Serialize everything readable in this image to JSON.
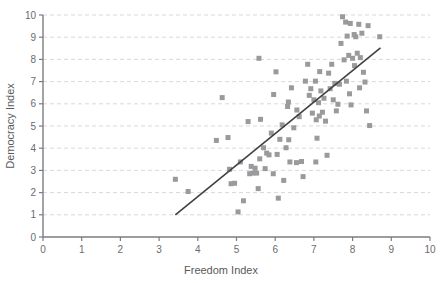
{
  "chart_data": {
    "type": "scatter",
    "title": "",
    "subtitle": "",
    "xlabel": "Freedom Index",
    "ylabel": "Democracy Index",
    "xlim": [
      0,
      10
    ],
    "ylim": [
      0,
      10
    ],
    "xticks": [
      0,
      1,
      2,
      3,
      4,
      5,
      6,
      7,
      8,
      9,
      10
    ],
    "yticks": [
      0,
      1,
      2,
      3,
      4,
      5,
      6,
      7,
      8,
      9,
      10
    ],
    "grid": {
      "horizontal": true,
      "vertical": false,
      "style": "dashed",
      "color": "#d9d9dd"
    },
    "legend": {
      "visible": false,
      "position": "none"
    },
    "marker": {
      "shape": "square",
      "color": "#9a9a9c",
      "size": 5
    },
    "trendline": {
      "visible": true,
      "color": "#404042",
      "width": 1.6,
      "x_start": 3.42,
      "y_start": 1.0,
      "x_end": 8.72,
      "y_end": 8.52
    },
    "series": [
      {
        "name": "Countries",
        "points": [
          [
            3.42,
            2.6
          ],
          [
            3.75,
            2.05
          ],
          [
            4.48,
            4.35
          ],
          [
            4.63,
            6.28
          ],
          [
            4.78,
            4.48
          ],
          [
            4.82,
            3.05
          ],
          [
            4.86,
            2.4
          ],
          [
            4.95,
            2.42
          ],
          [
            5.04,
            1.13
          ],
          [
            5.1,
            3.38
          ],
          [
            5.18,
            1.63
          ],
          [
            5.3,
            5.2
          ],
          [
            5.34,
            2.85
          ],
          [
            5.38,
            3.18
          ],
          [
            5.42,
            2.88
          ],
          [
            5.48,
            3.1
          ],
          [
            5.52,
            2.88
          ],
          [
            5.56,
            2.18
          ],
          [
            5.58,
            8.05
          ],
          [
            5.6,
            3.52
          ],
          [
            5.62,
            5.3
          ],
          [
            5.7,
            4.02
          ],
          [
            5.74,
            3.08
          ],
          [
            5.78,
            3.78
          ],
          [
            5.84,
            3.7
          ],
          [
            5.9,
            4.68
          ],
          [
            5.96,
            6.42
          ],
          [
            6.02,
            7.44
          ],
          [
            6.08,
            1.75
          ],
          [
            6.12,
            4.4
          ],
          [
            6.18,
            5.05
          ],
          [
            6.22,
            2.55
          ],
          [
            6.28,
            4.02
          ],
          [
            6.32,
            5.88
          ],
          [
            6.34,
            6.08
          ],
          [
            6.38,
            3.38
          ],
          [
            6.42,
            6.72
          ],
          [
            6.48,
            4.92
          ],
          [
            6.56,
            5.72
          ],
          [
            6.62,
            5.42
          ],
          [
            6.68,
            3.4
          ],
          [
            6.72,
            2.72
          ],
          [
            6.78,
            7.02
          ],
          [
            6.84,
            7.78
          ],
          [
            6.88,
            6.38
          ],
          [
            6.92,
            6.68
          ],
          [
            6.96,
            5.58
          ],
          [
            7.0,
            6.18
          ],
          [
            7.04,
            7.02
          ],
          [
            7.06,
            5.28
          ],
          [
            7.08,
            4.45
          ],
          [
            7.12,
            6.05
          ],
          [
            7.14,
            5.45
          ],
          [
            7.18,
            6.58
          ],
          [
            7.22,
            5.62
          ],
          [
            7.26,
            6.25
          ],
          [
            7.3,
            5.22
          ],
          [
            7.34,
            3.68
          ],
          [
            7.38,
            7.38
          ],
          [
            7.42,
            6.68
          ],
          [
            7.46,
            7.78
          ],
          [
            7.5,
            6.18
          ],
          [
            7.54,
            6.92
          ],
          [
            7.58,
            5.68
          ],
          [
            7.62,
            5.98
          ],
          [
            7.66,
            6.88
          ],
          [
            7.7,
            8.72
          ],
          [
            7.74,
            9.92
          ],
          [
            7.78,
            7.98
          ],
          [
            7.82,
            9.68
          ],
          [
            7.84,
            7.02
          ],
          [
            7.86,
            9.05
          ],
          [
            7.9,
            8.18
          ],
          [
            7.94,
            9.62
          ],
          [
            7.96,
            5.95
          ],
          [
            8.0,
            8.05
          ],
          [
            8.04,
            9.12
          ],
          [
            8.08,
            9.02
          ],
          [
            8.12,
            8.28
          ],
          [
            8.16,
            9.58
          ],
          [
            8.2,
            8.08
          ],
          [
            8.24,
            9.18
          ],
          [
            8.28,
            7.42
          ],
          [
            8.32,
            6.98
          ],
          [
            8.36,
            5.68
          ],
          [
            8.4,
            9.52
          ],
          [
            8.44,
            5.02
          ],
          [
            8.7,
            9.02
          ],
          [
            6.05,
            3.72
          ],
          [
            6.55,
            3.35
          ],
          [
            7.05,
            3.38
          ],
          [
            5.95,
            2.85
          ],
          [
            6.35,
            4.38
          ],
          [
            7.15,
            7.45
          ],
          [
            8.05,
            7.72
          ],
          [
            8.18,
            6.72
          ],
          [
            7.92,
            6.45
          ]
        ]
      }
    ]
  },
  "axes": {
    "x_title": "Freedom Index",
    "y_title": "Democracy Index",
    "x_tick_labels": [
      "0",
      "1",
      "2",
      "3",
      "4",
      "5",
      "6",
      "7",
      "8",
      "9",
      "10"
    ],
    "y_tick_labels": [
      "0",
      "1",
      "2",
      "3",
      "4",
      "5",
      "6",
      "7",
      "8",
      "9",
      "10"
    ]
  },
  "colors": {
    "marker": "#9a9a9c",
    "trendline": "#404042",
    "gridline": "#d9d9dd",
    "axis": "#7d7d80",
    "tick_text": "#6b6b6d",
    "title_text": "#59595b",
    "background": "#ffffff"
  }
}
